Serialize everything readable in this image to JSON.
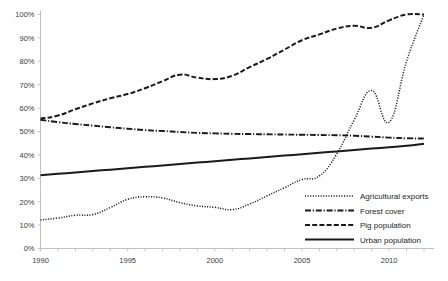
{
  "chart_data": {
    "type": "line",
    "title": "",
    "subtitle": "",
    "xlabel": "",
    "ylabel": "",
    "xlim": [
      1990,
      2012
    ],
    "ylim": [
      0,
      100
    ],
    "grid": false,
    "legend_position": "inside-bottom-right",
    "y_ticks": [
      "0%",
      "10%",
      "20%",
      "30%",
      "40%",
      "50%",
      "60%",
      "70%",
      "80%",
      "90%",
      "100%"
    ],
    "y_tick_values": [
      0,
      10,
      20,
      30,
      40,
      50,
      60,
      70,
      80,
      90,
      100
    ],
    "x_ticks": [
      "1990",
      "1995",
      "2000",
      "2005",
      "2010"
    ],
    "x_tick_values": [
      1990,
      1995,
      2000,
      2005,
      2010
    ],
    "x": [
      1990,
      1991,
      1992,
      1993,
      1994,
      1995,
      1996,
      1997,
      1998,
      1999,
      2000,
      2001,
      2002,
      2003,
      2004,
      2005,
      2006,
      2007,
      2008,
      2009,
      2010,
      2011,
      2012
    ],
    "series": [
      {
        "name": "Agricultural exports",
        "style": "dotted",
        "color": "#1a1a1a",
        "values": [
          12.2,
          13.0,
          14.2,
          14.5,
          17.5,
          21.0,
          22.1,
          21.6,
          19.6,
          18.2,
          17.6,
          16.6,
          19.0,
          22.5,
          26.0,
          29.5,
          31.0,
          40.5,
          55.0,
          67.5,
          54.0,
          80.0,
          100.0
        ]
      },
      {
        "name": "Forest cover",
        "style": "dash-dot",
        "color": "#1a1a1a",
        "values": [
          55.0,
          54.0,
          53.2,
          52.5,
          51.8,
          51.2,
          50.6,
          50.2,
          49.8,
          49.4,
          49.2,
          49.0,
          48.9,
          48.8,
          48.7,
          48.6,
          48.5,
          48.4,
          48.2,
          47.8,
          47.4,
          47.1,
          47.0
        ]
      },
      {
        "name": "Pig population",
        "style": "dashed",
        "color": "#1a1a1a",
        "values": [
          55.5,
          56.8,
          59.5,
          62.0,
          64.2,
          66.0,
          68.5,
          71.5,
          74.3,
          73.0,
          72.4,
          73.8,
          77.5,
          81.0,
          85.0,
          89.0,
          91.5,
          94.0,
          95.2,
          94.3,
          97.5,
          100.0,
          100.0
        ]
      },
      {
        "name": "Urban population",
        "style": "solid",
        "color": "#1a1a1a",
        "values": [
          31.3,
          31.9,
          32.5,
          33.1,
          33.7,
          34.3,
          34.9,
          35.5,
          36.1,
          36.7,
          37.3,
          37.9,
          38.5,
          39.1,
          39.7,
          40.3,
          40.9,
          41.5,
          42.1,
          42.7,
          43.3,
          43.9,
          44.8
        ]
      }
    ],
    "legend": [
      {
        "label": "Agricultural exports",
        "style": "dotted"
      },
      {
        "label": "Forest cover",
        "style": "dash-dot"
      },
      {
        "label": "Pig population",
        "style": "dashed"
      },
      {
        "label": "Urban population",
        "style": "solid"
      }
    ]
  }
}
